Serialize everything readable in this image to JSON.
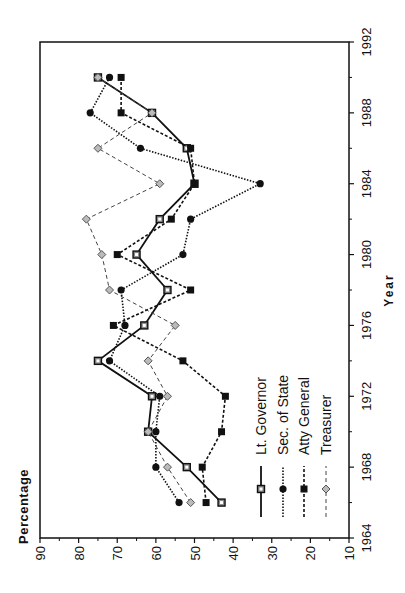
{
  "chart_data": {
    "type": "line",
    "orientation": "rotated-90-ccw",
    "title": "",
    "xlabel": "Year",
    "ylabel": "Percentage",
    "xlim": [
      1964,
      1992
    ],
    "ylim": [
      10,
      90
    ],
    "x_ticks": [
      1964,
      1968,
      1972,
      1976,
      1980,
      1984,
      1988,
      1992
    ],
    "y_ticks": [
      90,
      80,
      70,
      60,
      50,
      40,
      30,
      20,
      10
    ],
    "grid": false,
    "legend_position": "inside-lower-right",
    "x": [
      1966,
      1968,
      1970,
      1972,
      1974,
      1976,
      1978,
      1980,
      1982,
      1984,
      1986,
      1988,
      1990
    ],
    "series": [
      {
        "name": "Lt. Governor",
        "style": "solid",
        "marker": "open-square",
        "values": [
          43,
          52,
          62,
          61,
          75,
          63,
          57,
          65,
          59,
          50,
          52,
          61,
          75
        ]
      },
      {
        "name": "Sec. of State",
        "style": "dotted",
        "marker": "filled-circle",
        "values": [
          54,
          60,
          60,
          59,
          72,
          68,
          69,
          53,
          51,
          33,
          64,
          77,
          72
        ]
      },
      {
        "name": "Atty General",
        "style": "dashed",
        "marker": "filled-square",
        "values": [
          47,
          48,
          43,
          42,
          53,
          71,
          51,
          70,
          56,
          50,
          51,
          69,
          69
        ]
      },
      {
        "name": "Treasurer",
        "style": "long-dash",
        "marker": "open-diamond",
        "values": [
          51,
          57,
          62,
          57,
          62,
          55,
          72,
          74,
          78,
          59,
          75,
          61,
          75
        ]
      }
    ]
  }
}
